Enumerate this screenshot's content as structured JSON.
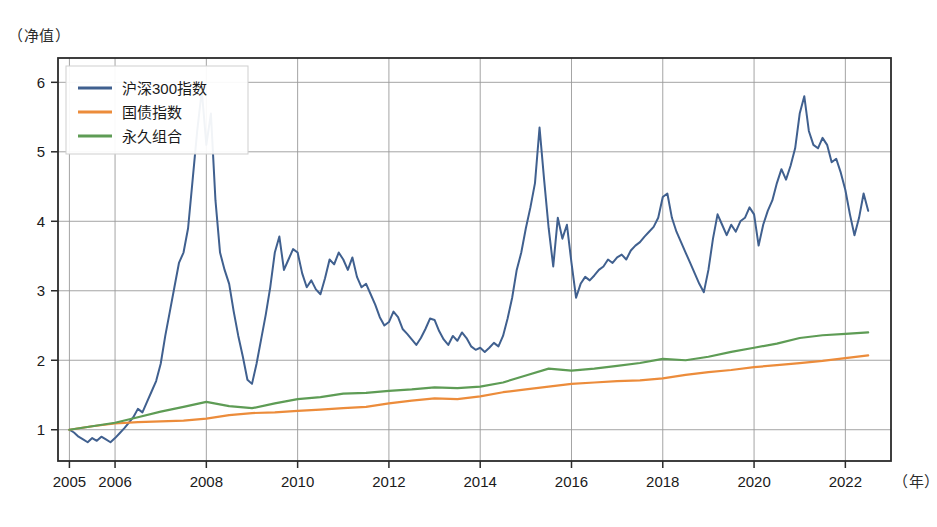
{
  "chart_data": {
    "type": "line",
    "title": "",
    "ylabel": "（净值）",
    "xlabel": "（年）",
    "xlim": [
      2004.75,
      2023.0
    ],
    "ylim": [
      0.55,
      6.35
    ],
    "yticks": [
      1,
      2,
      3,
      4,
      5,
      6
    ],
    "xticks": [
      2005,
      2006,
      2008,
      2010,
      2012,
      2014,
      2016,
      2018,
      2020,
      2022
    ],
    "grid": true,
    "legend_position": "upper-left",
    "colors": {
      "hs300": "#40608f",
      "bond": "#ec8c3b",
      "permanent": "#5e9c55",
      "grid": "#9a9a9a",
      "frame": "#2b2b2b"
    },
    "series": [
      {
        "name": "沪深300指数",
        "color": "#40608f",
        "x": [
          2005.0,
          2005.1,
          2005.2,
          2005.3,
          2005.4,
          2005.5,
          2005.6,
          2005.7,
          2005.8,
          2005.9,
          2006.0,
          2006.1,
          2006.2,
          2006.3,
          2006.4,
          2006.5,
          2006.6,
          2006.7,
          2006.8,
          2006.9,
          2007.0,
          2007.1,
          2007.2,
          2007.3,
          2007.4,
          2007.5,
          2007.6,
          2007.7,
          2007.8,
          2007.9,
          2008.0,
          2008.1,
          2008.2,
          2008.3,
          2008.4,
          2008.5,
          2008.6,
          2008.7,
          2008.8,
          2008.9,
          2009.0,
          2009.1,
          2009.2,
          2009.3,
          2009.4,
          2009.5,
          2009.6,
          2009.7,
          2009.8,
          2009.9,
          2010.0,
          2010.1,
          2010.2,
          2010.3,
          2010.4,
          2010.5,
          2010.6,
          2010.7,
          2010.8,
          2010.9,
          2011.0,
          2011.1,
          2011.2,
          2011.3,
          2011.4,
          2011.5,
          2011.6,
          2011.7,
          2011.8,
          2011.9,
          2012.0,
          2012.1,
          2012.2,
          2012.3,
          2012.4,
          2012.5,
          2012.6,
          2012.7,
          2012.8,
          2012.9,
          2013.0,
          2013.1,
          2013.2,
          2013.3,
          2013.4,
          2013.5,
          2013.6,
          2013.7,
          2013.8,
          2013.9,
          2014.0,
          2014.1,
          2014.2,
          2014.3,
          2014.4,
          2014.5,
          2014.6,
          2014.7,
          2014.8,
          2014.9,
          2015.0,
          2015.1,
          2015.2,
          2015.3,
          2015.4,
          2015.5,
          2015.6,
          2015.7,
          2015.8,
          2015.9,
          2016.0,
          2016.1,
          2016.2,
          2016.3,
          2016.4,
          2016.5,
          2016.6,
          2016.7,
          2016.8,
          2016.9,
          2017.0,
          2017.1,
          2017.2,
          2017.3,
          2017.4,
          2017.5,
          2017.6,
          2017.7,
          2017.8,
          2017.9,
          2018.0,
          2018.1,
          2018.2,
          2018.3,
          2018.4,
          2018.5,
          2018.6,
          2018.7,
          2018.8,
          2018.9,
          2019.0,
          2019.1,
          2019.2,
          2019.3,
          2019.4,
          2019.5,
          2019.6,
          2019.7,
          2019.8,
          2019.9,
          2020.0,
          2020.1,
          2020.2,
          2020.3,
          2020.4,
          2020.5,
          2020.6,
          2020.7,
          2020.8,
          2020.9,
          2021.0,
          2021.1,
          2021.2,
          2021.3,
          2021.4,
          2021.5,
          2021.6,
          2021.7,
          2021.8,
          2021.9,
          2022.0,
          2022.1,
          2022.2,
          2022.3,
          2022.4,
          2022.5
        ],
        "y": [
          1.0,
          0.96,
          0.9,
          0.86,
          0.82,
          0.88,
          0.84,
          0.9,
          0.86,
          0.82,
          0.88,
          0.95,
          1.02,
          1.1,
          1.18,
          1.3,
          1.25,
          1.4,
          1.55,
          1.7,
          1.95,
          2.35,
          2.7,
          3.05,
          3.4,
          3.55,
          3.9,
          4.6,
          5.3,
          5.88,
          5.1,
          5.55,
          4.3,
          3.55,
          3.3,
          3.1,
          2.7,
          2.35,
          2.05,
          1.72,
          1.66,
          1.95,
          2.3,
          2.65,
          3.05,
          3.55,
          3.78,
          3.3,
          3.45,
          3.6,
          3.55,
          3.25,
          3.05,
          3.15,
          3.02,
          2.95,
          3.18,
          3.45,
          3.38,
          3.55,
          3.45,
          3.3,
          3.48,
          3.2,
          3.05,
          3.1,
          2.95,
          2.8,
          2.62,
          2.5,
          2.55,
          2.7,
          2.62,
          2.45,
          2.38,
          2.3,
          2.22,
          2.32,
          2.45,
          2.6,
          2.58,
          2.42,
          2.3,
          2.22,
          2.35,
          2.28,
          2.4,
          2.32,
          2.2,
          2.15,
          2.18,
          2.12,
          2.18,
          2.25,
          2.2,
          2.35,
          2.6,
          2.9,
          3.3,
          3.55,
          3.9,
          4.2,
          4.55,
          5.35,
          4.6,
          3.9,
          3.35,
          4.05,
          3.75,
          3.95,
          3.4,
          2.9,
          3.1,
          3.2,
          3.15,
          3.22,
          3.3,
          3.35,
          3.45,
          3.4,
          3.48,
          3.52,
          3.45,
          3.58,
          3.65,
          3.7,
          3.78,
          3.85,
          3.92,
          4.05,
          4.35,
          4.4,
          4.05,
          3.85,
          3.7,
          3.55,
          3.4,
          3.25,
          3.1,
          2.98,
          3.3,
          3.75,
          4.1,
          3.95,
          3.8,
          3.95,
          3.85,
          4.0,
          4.05,
          4.2,
          4.1,
          3.65,
          3.95,
          4.15,
          4.3,
          4.55,
          4.75,
          4.6,
          4.8,
          5.05,
          5.55,
          5.8,
          5.3,
          5.1,
          5.05,
          5.2,
          5.1,
          4.85,
          4.9,
          4.7,
          4.45,
          4.1,
          3.8,
          4.05,
          4.4,
          4.15
        ]
      },
      {
        "name": "国债指数",
        "color": "#ec8c3b",
        "x": [
          2005,
          2005.5,
          2006,
          2006.5,
          2007,
          2007.5,
          2008,
          2008.5,
          2009,
          2009.5,
          2010,
          2010.5,
          2011,
          2011.5,
          2012,
          2012.5,
          2013,
          2013.5,
          2014,
          2014.5,
          2015,
          2015.5,
          2016,
          2016.5,
          2017,
          2017.5,
          2018,
          2018.5,
          2019,
          2019.5,
          2020,
          2020.5,
          2021,
          2021.5,
          2022,
          2022.5
        ],
        "y": [
          1.0,
          1.05,
          1.09,
          1.11,
          1.12,
          1.13,
          1.16,
          1.21,
          1.24,
          1.25,
          1.27,
          1.29,
          1.31,
          1.33,
          1.38,
          1.42,
          1.45,
          1.44,
          1.48,
          1.54,
          1.58,
          1.62,
          1.66,
          1.68,
          1.7,
          1.71,
          1.74,
          1.79,
          1.83,
          1.86,
          1.9,
          1.93,
          1.96,
          1.99,
          2.03,
          2.07
        ]
      },
      {
        "name": "永久组合",
        "color": "#5e9c55",
        "x": [
          2005,
          2005.5,
          2006,
          2006.5,
          2007,
          2007.5,
          2008,
          2008.5,
          2009,
          2009.5,
          2010,
          2010.5,
          2011,
          2011.5,
          2012,
          2012.5,
          2013,
          2013.5,
          2014,
          2014.5,
          2015,
          2015.5,
          2016,
          2016.5,
          2017,
          2017.5,
          2018,
          2018.5,
          2019,
          2019.5,
          2020,
          2020.5,
          2021,
          2021.5,
          2022,
          2022.5
        ],
        "y": [
          1.0,
          1.05,
          1.1,
          1.18,
          1.26,
          1.33,
          1.4,
          1.34,
          1.31,
          1.38,
          1.44,
          1.47,
          1.52,
          1.53,
          1.56,
          1.58,
          1.61,
          1.6,
          1.62,
          1.68,
          1.78,
          1.88,
          1.85,
          1.88,
          1.92,
          1.96,
          2.02,
          2.0,
          2.05,
          2.12,
          2.18,
          2.24,
          2.32,
          2.36,
          2.38,
          2.4
        ]
      }
    ],
    "legend": [
      {
        "label": "沪深300指数",
        "color": "#40608f"
      },
      {
        "label": "国债指数",
        "color": "#ec8c3b"
      },
      {
        "label": "永久组合",
        "color": "#5e9c55"
      }
    ]
  }
}
